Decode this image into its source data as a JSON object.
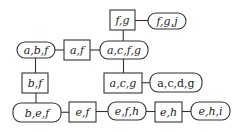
{
  "diagram": {
    "type": "junction-tree",
    "colors": {
      "stroke": "#333333",
      "text": "#222222",
      "background": "#ffffff"
    },
    "nodes": [
      {
        "id": "fg",
        "label": "f,g",
        "kind": "separator",
        "italic": true
      },
      {
        "id": "fgj",
        "label": "f,g,j",
        "kind": "clique",
        "italic": true
      },
      {
        "id": "abf",
        "label": "a,b,f",
        "kind": "clique",
        "italic": true
      },
      {
        "id": "af",
        "label": "a,f",
        "kind": "separator",
        "italic": true
      },
      {
        "id": "acfg",
        "label": "a,c,f,g",
        "kind": "clique",
        "italic": true
      },
      {
        "id": "bf",
        "label": "b,f",
        "kind": "separator",
        "italic": true
      },
      {
        "id": "acg",
        "label": "a,c,g",
        "kind": "separator",
        "italic": true
      },
      {
        "id": "acdg",
        "label": "a,c,d,g",
        "kind": "clique",
        "italic": false
      },
      {
        "id": "bef",
        "label": "b,e,f",
        "kind": "clique",
        "italic": true
      },
      {
        "id": "ef",
        "label": "e,f",
        "kind": "separator",
        "italic": true
      },
      {
        "id": "efh",
        "label": "e,f,h",
        "kind": "clique",
        "italic": true
      },
      {
        "id": "eh",
        "label": "e,h",
        "kind": "separator",
        "italic": true
      },
      {
        "id": "ehi",
        "label": "e,h,i",
        "kind": "clique",
        "italic": true
      }
    ],
    "edges": [
      [
        "fg",
        "fgj"
      ],
      [
        "fg",
        "acfg"
      ],
      [
        "abf",
        "af"
      ],
      [
        "af",
        "acfg"
      ],
      [
        "abf",
        "bf"
      ],
      [
        "acfg",
        "acg"
      ],
      [
        "acg",
        "acdg"
      ],
      [
        "bf",
        "bef"
      ],
      [
        "bef",
        "ef"
      ],
      [
        "ef",
        "efh"
      ],
      [
        "efh",
        "eh"
      ],
      [
        "eh",
        "ehi"
      ]
    ]
  }
}
